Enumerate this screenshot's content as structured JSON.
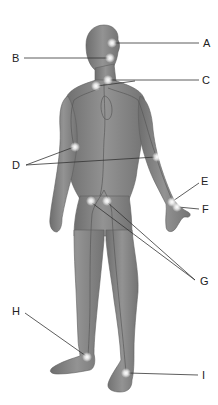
{
  "diagram": {
    "colors": {
      "background": "#ffffff",
      "skin": "#8a8a8a",
      "skin_dark": "#6e6e6e",
      "skin_light": "#a3a3a3",
      "vessel": "#5a5a5a",
      "leader_line": "#333333",
      "pulse_glow": "#ffffff",
      "label_text": "#222222"
    },
    "labels": [
      {
        "id": "A",
        "text": "A",
        "x": 203,
        "y": 38
      },
      {
        "id": "B",
        "text": "B",
        "x": 12,
        "y": 53
      },
      {
        "id": "C",
        "text": "C",
        "x": 202,
        "y": 75
      },
      {
        "id": "D",
        "text": "D",
        "x": 12,
        "y": 160
      },
      {
        "id": "E",
        "text": "E",
        "x": 201,
        "y": 176
      },
      {
        "id": "F",
        "text": "F",
        "x": 202,
        "y": 204
      },
      {
        "id": "G",
        "text": "G",
        "x": 200,
        "y": 276
      },
      {
        "id": "H",
        "text": "H",
        "x": 12,
        "y": 306
      },
      {
        "id": "I",
        "text": "I",
        "x": 202,
        "y": 370
      }
    ],
    "pulse_points": [
      {
        "label": "A",
        "x": 112,
        "y": 43
      },
      {
        "label": "B",
        "x": 110,
        "y": 58
      },
      {
        "label": "C",
        "x": 108,
        "y": 80
      },
      {
        "label": "C",
        "x": 96,
        "y": 86
      },
      {
        "label": "D",
        "x": 75,
        "y": 147
      },
      {
        "label": "D",
        "x": 157,
        "y": 157
      },
      {
        "label": "E",
        "x": 172,
        "y": 202
      },
      {
        "label": "F",
        "x": 177,
        "y": 207
      },
      {
        "label": "G",
        "x": 91,
        "y": 201
      },
      {
        "label": "G",
        "x": 107,
        "y": 201
      },
      {
        "label": "H",
        "x": 87,
        "y": 357
      },
      {
        "label": "I",
        "x": 126,
        "y": 373
      }
    ],
    "leader_lines": [
      {
        "label": "A",
        "x1": 114,
        "y1": 43,
        "x2": 199,
        "y2": 43
      },
      {
        "label": "B",
        "x1": 24,
        "y1": 58,
        "x2": 109,
        "y2": 58
      },
      {
        "label": "C",
        "x1": 97,
        "y1": 86,
        "x2": 135,
        "y2": 81
      },
      {
        "label": "C",
        "x1": 110,
        "y1": 80,
        "x2": 199,
        "y2": 80
      },
      {
        "label": "D",
        "x1": 26,
        "y1": 165,
        "x2": 74,
        "y2": 147
      },
      {
        "label": "D",
        "x1": 26,
        "y1": 165,
        "x2": 156,
        "y2": 157
      },
      {
        "label": "E",
        "x1": 173,
        "y1": 201,
        "x2": 199,
        "y2": 183
      },
      {
        "label": "F",
        "x1": 178,
        "y1": 207,
        "x2": 199,
        "y2": 209
      },
      {
        "label": "G",
        "x1": 92,
        "y1": 203,
        "x2": 195,
        "y2": 280
      },
      {
        "label": "G",
        "x1": 108,
        "y1": 203,
        "x2": 195,
        "y2": 280
      },
      {
        "label": "H",
        "x1": 25,
        "y1": 313,
        "x2": 86,
        "y2": 356
      },
      {
        "label": "I",
        "x1": 128,
        "y1": 373,
        "x2": 198,
        "y2": 375
      }
    ]
  }
}
